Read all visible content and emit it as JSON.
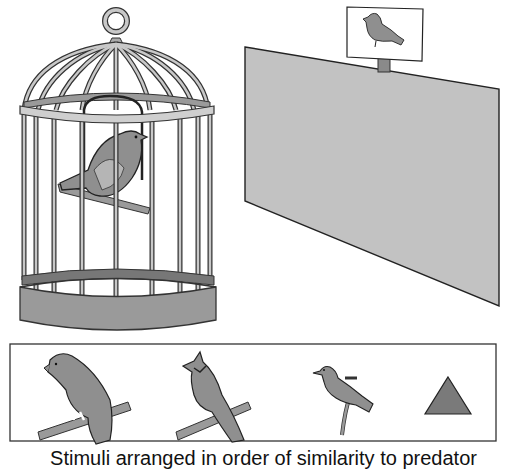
{
  "figure": {
    "cage": {
      "label": "caged bird"
    },
    "screen": {
      "label": "projection screen",
      "color": "#bdbdbd"
    },
    "sign": {
      "label": "bird sign above screen"
    },
    "stimuli": {
      "label": "stimuli panel",
      "items": [
        "hawk",
        "jay",
        "songbird",
        "triangle"
      ],
      "colors": {
        "bird": "#8f8f8f",
        "triangle": "#7a7a7a"
      }
    },
    "caption": "Stimuli arranged in order of similarity to predator"
  }
}
